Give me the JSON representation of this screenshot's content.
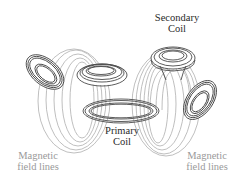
{
  "diagram": {
    "labels": {
      "secondary_coil": {
        "line1": "Secondary",
        "line2": "Coil"
      },
      "primary_coil": {
        "line1": "Primary",
        "line2": "Coil"
      },
      "field_lines_left": {
        "line1": "Magnetic",
        "line2": "field lines"
      },
      "field_lines_right": {
        "line1": "Magnetic",
        "line2": "field lines"
      }
    },
    "colors": {
      "coil_stroke": "#4a4a4a",
      "field_line_stroke": "#b8b8b8",
      "label_dark": "#2a2a2a",
      "label_grey": "#9a9a9a",
      "background": "#ffffff"
    },
    "components": [
      {
        "name": "primary-coil",
        "type": "coil"
      },
      {
        "name": "secondary-coil",
        "type": "coil"
      },
      {
        "name": "receiver-coil-left",
        "type": "coil"
      },
      {
        "name": "receiver-coil-center-left",
        "type": "coil"
      },
      {
        "name": "receiver-coil-right",
        "type": "coil"
      },
      {
        "name": "magnetic-field-lines-left",
        "type": "field-lines"
      },
      {
        "name": "magnetic-field-lines-right",
        "type": "field-lines"
      }
    ]
  }
}
